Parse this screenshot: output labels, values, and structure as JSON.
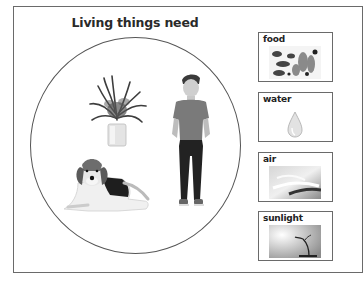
{
  "worksheet": {
    "title": "Living things need",
    "circle_items": [
      {
        "name": "plant",
        "icon": "potted-plant-icon"
      },
      {
        "name": "boy",
        "icon": "boy-icon"
      },
      {
        "name": "dog",
        "icon": "beagle-dog-icon"
      }
    ],
    "needs": [
      {
        "label": "food",
        "icon": "food-icon"
      },
      {
        "label": "water",
        "icon": "water-drop-icon"
      },
      {
        "label": "air",
        "icon": "air-icon"
      },
      {
        "label": "sunlight",
        "icon": "sunlight-icon"
      }
    ]
  },
  "colors": {
    "border": "#6a6a6a",
    "text": "#222222",
    "background": "#ffffff"
  }
}
